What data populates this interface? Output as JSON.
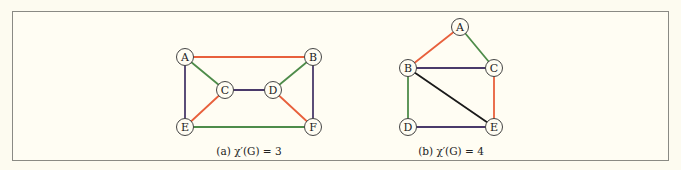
{
  "colors": {
    "red": "#e8603c",
    "green": "#4e8c4a",
    "purple": "#4a3a6a",
    "black": "#1a1a1a"
  },
  "graphs": [
    {
      "id": "a",
      "caption": "(a) χ′(G) = 3",
      "nodes": [
        "A",
        "B",
        "C",
        "D",
        "E",
        "F"
      ],
      "edges": [
        {
          "from": "A",
          "to": "B",
          "color": "red"
        },
        {
          "from": "A",
          "to": "C",
          "color": "green"
        },
        {
          "from": "A",
          "to": "E",
          "color": "purple"
        },
        {
          "from": "B",
          "to": "D",
          "color": "green"
        },
        {
          "from": "B",
          "to": "F",
          "color": "purple"
        },
        {
          "from": "C",
          "to": "D",
          "color": "purple"
        },
        {
          "from": "C",
          "to": "E",
          "color": "red"
        },
        {
          "from": "D",
          "to": "F",
          "color": "red"
        },
        {
          "from": "E",
          "to": "F",
          "color": "green"
        }
      ]
    },
    {
      "id": "b",
      "caption": "(b) χ′(G) = 4",
      "nodes": [
        "A",
        "B",
        "C",
        "D",
        "E"
      ],
      "edges": [
        {
          "from": "A",
          "to": "B",
          "color": "red"
        },
        {
          "from": "A",
          "to": "C",
          "color": "green"
        },
        {
          "from": "B",
          "to": "C",
          "color": "purple"
        },
        {
          "from": "B",
          "to": "D",
          "color": "green"
        },
        {
          "from": "B",
          "to": "E",
          "color": "black"
        },
        {
          "from": "C",
          "to": "E",
          "color": "red"
        },
        {
          "from": "D",
          "to": "E",
          "color": "purple"
        }
      ]
    }
  ]
}
